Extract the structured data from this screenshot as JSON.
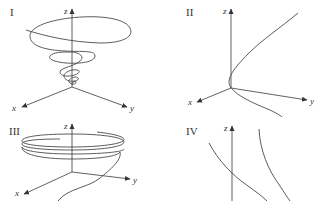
{
  "panels": [
    {
      "id": "I",
      "label": "I",
      "axes": {
        "x": "x",
        "y": "y",
        "z": "z"
      },
      "curve": "conical spiral narrowing to origin"
    },
    {
      "id": "II",
      "label": "II",
      "axes": {
        "x": "x",
        "y": "y",
        "z": "z"
      },
      "curve": "parabola-like curve bending near origin"
    },
    {
      "id": "III",
      "label": "III",
      "axes": {
        "x": "x",
        "y": "y",
        "z": "z"
      },
      "curve": "helix with flat rings above origin"
    },
    {
      "id": "IV",
      "label": "IV",
      "axes": {
        "z": "z"
      },
      "curve": "two descending curves"
    }
  ],
  "colors": {
    "ink": "#3a3a3a",
    "background": "#ffffff"
  }
}
